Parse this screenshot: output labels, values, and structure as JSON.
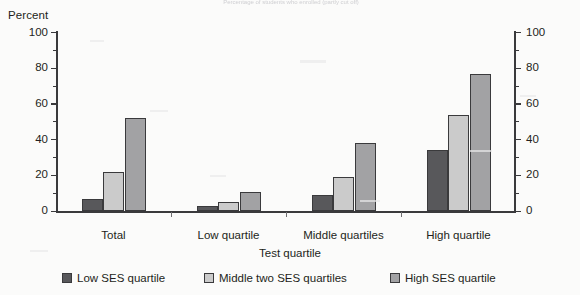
{
  "figure": {
    "cut_off_title": "Percentage of students who enrolled (partly cut off)",
    "unit_label": "Percent"
  },
  "chart_data": {
    "type": "bar",
    "title": "",
    "xlabel": "Test quartile",
    "ylabel": "Percent",
    "ylim": [
      0,
      100
    ],
    "yticks": [
      0,
      20,
      40,
      60,
      80,
      100
    ],
    "ytick_labels": [
      "0",
      "20",
      "40",
      "60",
      "80",
      "100"
    ],
    "minor_yticks": [
      10,
      30,
      50,
      70,
      90
    ],
    "dual_axis": true,
    "right_ytick_labels": [
      "0",
      "20",
      "40",
      "60",
      "80",
      "100"
    ],
    "grid": false,
    "legend_position": "bottom",
    "categories": [
      "Total",
      "Low quartile",
      "Middle quartiles",
      "High quartile"
    ],
    "series": [
      {
        "name": "Low SES quartile",
        "color": "#58585b",
        "values": [
          7,
          3,
          9,
          34
        ]
      },
      {
        "name": "Middle two SES quartiles",
        "color": "#cbcbcb",
        "values": [
          22,
          5,
          19,
          54
        ]
      },
      {
        "name": "High SES quartile",
        "color": "#a2a2a4",
        "values": [
          52,
          11,
          38,
          77
        ]
      }
    ]
  }
}
